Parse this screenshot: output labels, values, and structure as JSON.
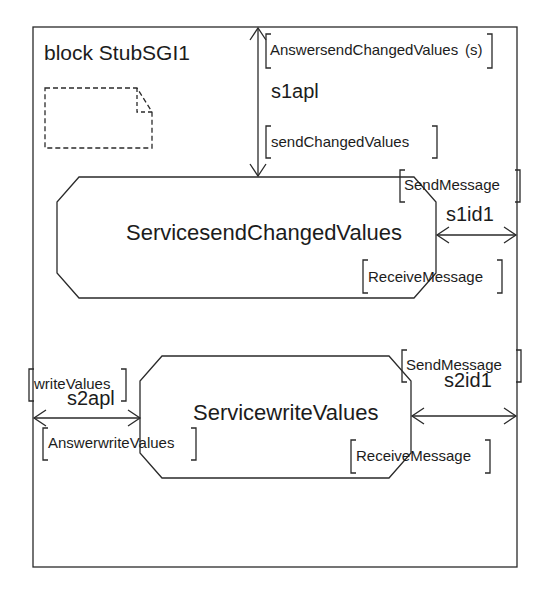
{
  "diagram": {
    "type": "SDL block diagram",
    "block": {
      "keyword": "block",
      "name": "StubSGI1",
      "title": "block StubSGI1"
    },
    "services": [
      {
        "id": "svc1",
        "name": "ServicesendChangedValues"
      },
      {
        "id": "svc2",
        "name": "ServicewriteValues"
      }
    ],
    "channels": [
      {
        "id": "s1apl",
        "label": "s1apl",
        "from": "environment (top)",
        "to": "ServicesendChangedValues",
        "bidirectional": true,
        "signals_in": "sendChangedValues",
        "signals_out": "AnswersendChangedValues",
        "signals_out_overlay": "(s)"
      },
      {
        "id": "s1id1",
        "label": "s1id1",
        "from": "ServicesendChangedValues",
        "to": "environment (right)",
        "bidirectional": true,
        "signals_out": "SendMessage",
        "signals_in": "ReceiveMessage"
      },
      {
        "id": "s2apl",
        "label": "s2apl",
        "from": "environment (left)",
        "to": "ServicewriteValues",
        "bidirectional": true,
        "signals_in": "writeValues",
        "signals_out": "AnswerwriteValues"
      },
      {
        "id": "s2id1",
        "label": "s2id1",
        "from": "ServicewriteValues",
        "to": "environment (right)",
        "bidirectional": true,
        "signals_out": "SendMessage",
        "signals_in": "ReceiveMessage"
      }
    ],
    "colors": {
      "line": "#2a2a2a",
      "text": "#1c1c1c",
      "background": "#ffffff"
    }
  }
}
